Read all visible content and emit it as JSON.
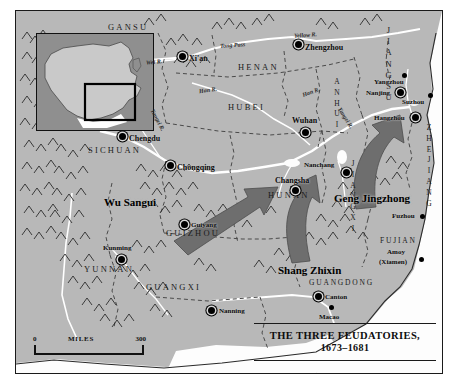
{
  "map": {
    "title_line1": "THE THREE FEUDATORIES,",
    "title_line2": "1673–1681",
    "colors": {
      "land": "#b8b8b8",
      "sea": "#fdfdfd",
      "arrow": "#6e6e6e",
      "border": "#1a1a1a",
      "inset_sea": "#8f8f8f",
      "inset_land": "#c9c9c9"
    },
    "scale": {
      "min": "0",
      "unit": "MILES",
      "max": "300"
    },
    "provinces": [
      {
        "name": "GANSU",
        "x": 92,
        "y": 12,
        "vertical": false
      },
      {
        "name": "HENAN",
        "x": 222,
        "y": 52,
        "vertical": false
      },
      {
        "name": "JIANGSU",
        "x": 368,
        "y": 18,
        "vertical": true
      },
      {
        "name": "HUBEI",
        "x": 212,
        "y": 92,
        "vertical": false
      },
      {
        "name": "ANHUI",
        "x": 317,
        "y": 68,
        "vertical": true
      },
      {
        "name": "ZHEJIANG",
        "x": 411,
        "y": 115,
        "vertical": true
      },
      {
        "name": "SICHUAN",
        "x": 72,
        "y": 135,
        "vertical": false
      },
      {
        "name": "HUNAN",
        "x": 252,
        "y": 180,
        "vertical": false
      },
      {
        "name": "JIANGXI",
        "x": 333,
        "y": 150,
        "vertical": true
      },
      {
        "name": "GUIZHOU",
        "x": 150,
        "y": 218,
        "vertical": false
      },
      {
        "name": "FUJIAN",
        "x": 364,
        "y": 226,
        "vertical": false
      },
      {
        "name": "YUNNAN",
        "x": 68,
        "y": 254,
        "vertical": false
      },
      {
        "name": "GUANGXI",
        "x": 130,
        "y": 272,
        "vertical": false
      },
      {
        "name": "GUANGDONG",
        "x": 293,
        "y": 268,
        "vertical": false
      }
    ],
    "cities": [
      {
        "name": "Xi'an",
        "x": 172,
        "y": 44,
        "dot": "ring",
        "anchor": "left"
      },
      {
        "name": "Zhengzhou",
        "x": 289,
        "y": 33,
        "dot": "ring",
        "anchor": "left"
      },
      {
        "name": "Chengdu",
        "x": 113,
        "y": 124,
        "dot": "ring",
        "anchor": "left"
      },
      {
        "name": "Chongqing",
        "x": 161,
        "y": 153,
        "dot": "ring",
        "anchor": "left"
      },
      {
        "name": "Wuhan",
        "x": 280,
        "y": 108,
        "dot": "ring",
        "anchor": "above"
      },
      {
        "name": "Yangzhou",
        "x": 391,
        "y": 68,
        "dot": "plain",
        "anchor": "left"
      },
      {
        "name": "Nanjing",
        "x": 385,
        "y": 80,
        "dot": "ring",
        "anchor": "left"
      },
      {
        "name": "Suzhou",
        "x": 417,
        "y": 88,
        "dot": "plain",
        "anchor": "left"
      },
      {
        "name": "Hangzhou",
        "x": 399,
        "y": 105,
        "dot": "ring",
        "anchor": "left"
      },
      {
        "name": "Nanchang",
        "x": 318,
        "y": 150,
        "dot": "ring",
        "anchor": "left"
      },
      {
        "name": "Changsha",
        "x": 269,
        "y": 168,
        "dot": "ring",
        "anchor": "above"
      },
      {
        "name": "Guiyang",
        "x": 174,
        "y": 212,
        "dot": "ring",
        "anchor": "left"
      },
      {
        "name": "Kunming",
        "x": 97,
        "y": 236,
        "dot": "ring",
        "anchor": "above"
      },
      {
        "name": "Fuzhou",
        "x": 405,
        "y": 202,
        "dot": "plain",
        "anchor": "left"
      },
      {
        "name": "Nanning",
        "x": 202,
        "y": 297,
        "dot": "ring",
        "anchor": "left"
      },
      {
        "name": "Canton",
        "x": 309,
        "y": 283,
        "dot": "ring",
        "anchor": "left"
      },
      {
        "name": "Macao",
        "x": 315,
        "y": 301,
        "dot": "plain",
        "anchor": "below"
      }
    ],
    "city_pairs": [
      {
        "name": "Amoy",
        "x": 371,
        "y": 240
      },
      {
        "name": "(Xiamen)",
        "x": 365,
        "y": 249
      }
    ],
    "rivers": [
      {
        "name": "Wei R.",
        "x": 133,
        "y": 49,
        "rot": -6
      },
      {
        "name": "Han R.",
        "x": 185,
        "y": 78,
        "rot": -8
      },
      {
        "name": "Yellow R.",
        "x": 285,
        "y": 22,
        "rot": -4
      },
      {
        "name": "Han R.",
        "x": 290,
        "y": 79,
        "rot": -18
      },
      {
        "name": "Yangzi R.",
        "x": 135,
        "y": 108,
        "rot": 62
      },
      {
        "name": "Yangzi R.",
        "x": 323,
        "y": 104,
        "rot": 58
      },
      {
        "name": "Tong Pass",
        "x": 211,
        "y": 32,
        "rot": -4
      }
    ],
    "leaders": [
      {
        "name": "Wu Sangui",
        "x": 100,
        "y": 192
      },
      {
        "name": "Geng Jingzhong",
        "x": 330,
        "y": 207
      },
      {
        "name": "Shang Zhixin",
        "x": 276,
        "y": 252
      }
    ],
    "arrows": [
      {
        "label": "wu-sangui-advance-arrow"
      },
      {
        "label": "shang-zhixin-advance-arrow"
      },
      {
        "label": "geng-jingzhong-advance-arrow"
      }
    ]
  }
}
